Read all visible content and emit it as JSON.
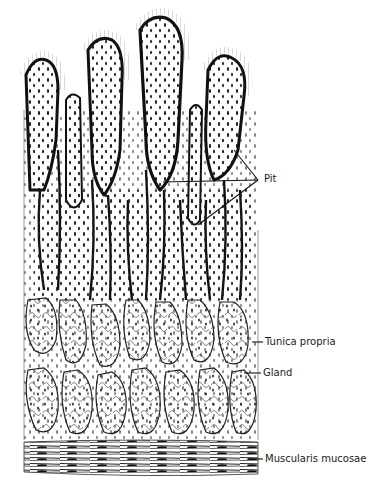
{
  "figure": {
    "ink_color": "#1a1a1a",
    "background": "#ffffff"
  },
  "labels": {
    "pit": "Pit",
    "tunica_propria": "Tunica propria",
    "gland": "Gland",
    "muscularis_mucosae": "Muscularis mucosae"
  }
}
